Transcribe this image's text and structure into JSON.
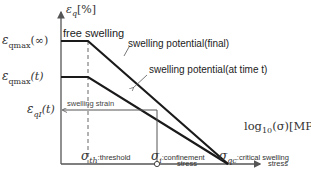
{
  "diagram": {
    "y_axis": {
      "symbol": "ε",
      "subscript": "q",
      "unit": "[%]"
    },
    "x_axis": {
      "label_prefix": "log",
      "label_sub": "10",
      "label_suffix": "(σ)[MPa]"
    },
    "y_ticks": [
      {
        "symbol": "ε",
        "sub": "qmax",
        "arg": "(∞)"
      },
      {
        "symbol": "ε",
        "sub": "qmax",
        "arg": "(t)"
      },
      {
        "symbol": "ε",
        "sub": "qI",
        "arg": "(t)"
      }
    ],
    "x_ticks": [
      {
        "symbol": "σ",
        "sub": "th",
        "desc": ":threshold",
        "desc2": ""
      },
      {
        "symbol": "σ",
        "sub": "i",
        "desc": ":confinement",
        "desc2": "stress"
      },
      {
        "symbol": "σ",
        "sub": "qc",
        "desc": ":critical swelling",
        "desc2": "stress"
      }
    ],
    "annotations": {
      "free_swelling": "free swelling",
      "potential_final": "swelling potential(final)",
      "potential_t": "swelling potential(at time t)",
      "swelling_strain": "swelling strain"
    },
    "colors": {
      "line": "#1a1a1a",
      "axis": "#555555",
      "text": "#222222"
    }
  }
}
